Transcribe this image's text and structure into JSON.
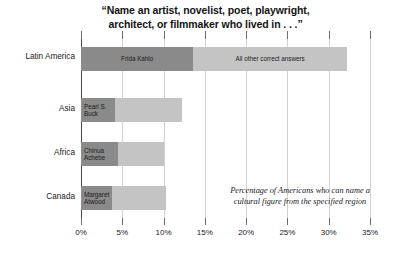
{
  "chart_data": {
    "type": "bar",
    "orientation": "horizontal",
    "stacked": true,
    "title": "“Name an artist, novelist, poet, playwright, architect, or filmmaker who lived in . . .”",
    "title_lines": [
      "“Name an artist, novelist, poet, playwright,",
      "architect, or filmmaker who lived in . . .”"
    ],
    "xlabel": "",
    "ylabel": "",
    "xlim": [
      0,
      35
    ],
    "xtick_values": [
      0,
      5,
      10,
      15,
      20,
      25,
      30,
      35
    ],
    "xtick_labels": [
      "0%",
      "5%",
      "10%",
      "15%",
      "20%",
      "25%",
      "30%",
      "35%"
    ],
    "grid": true,
    "legend_position": "in-bar-labels",
    "categories": [
      "Latin America",
      "Asia",
      "Africa",
      "Canada"
    ],
    "series": [
      {
        "name": "Named figure",
        "color": "#8a8a8a",
        "values": [
          13.6,
          4.1,
          4.5,
          3.8
        ]
      },
      {
        "name": "All other correct answers",
        "color": "#c4c4c4",
        "values": [
          18.6,
          8.1,
          5.6,
          6.5
        ]
      }
    ],
    "totals": [
      32.2,
      12.2,
      10.1,
      10.3
    ],
    "bar_labels": [
      {
        "primary": "Frida Kahlo",
        "other": "All other correct answers"
      },
      {
        "primary": "Pearl S.\nBuck",
        "other": ""
      },
      {
        "primary": "Chinua\nAchebe",
        "other": ""
      },
      {
        "primary": "Margaret\nAtwood",
        "other": ""
      }
    ],
    "annotation": "Percentage of Americans who can name a cultural figure from the specified region",
    "annotation_lines": [
      "Percentage of Americans who can name a",
      "cultural figure from the specified region"
    ]
  },
  "colors": {
    "primary_segment": "#8a8a8a",
    "other_segment": "#c4c4c4",
    "gridline": "#d2d2d2",
    "axis": "#4a4a4a",
    "text": "#1a1a1a",
    "background": "#ffffff"
  }
}
